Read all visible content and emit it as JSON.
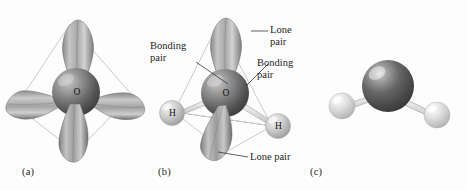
{
  "figure": {
    "background_color": "#fdfdfd",
    "panels": [
      {
        "id": "a",
        "caption": "(a)",
        "description": "Tetrahedral arrangement of four sp3 hybrid orbital lobes on oxygen",
        "atom_labels": [
          "O"
        ],
        "lobe_count": 4
      },
      {
        "id": "b",
        "caption": "(b)",
        "description": "Same tetrahedron with two bonding pairs to H atoms and two lone pairs labeled",
        "atom_labels": [
          "O",
          "H",
          "H"
        ],
        "lobe_count": 2,
        "annotations": [
          {
            "name": "lone-pair-top",
            "line1": "Lone",
            "line2": "pair"
          },
          {
            "name": "bonding-pair-left",
            "line1": "Bonding",
            "line2": "pair"
          },
          {
            "name": "bonding-pair-right",
            "line1": "Bonding",
            "line2": "pair"
          },
          {
            "name": "lone-pair-bottom",
            "line1": "Lone pair",
            "line2": ""
          }
        ]
      },
      {
        "id": "c",
        "caption": "(c)",
        "description": "Ball-and-stick bent model of water",
        "atom_labels": [],
        "lobe_count": 0
      }
    ]
  },
  "colors": {
    "oxygen_sphere_dark": "#4a4a4a",
    "oxygen_sphere_light": "#b9b9b9",
    "hydrogen_sphere_dark": "#a0a0a0",
    "hydrogen_sphere_light": "#e8e8e8",
    "lobe_dark": "#6e6e6e",
    "lobe_light": "#cfcfcf",
    "wireframe": "#b0b0b0",
    "dashed_line": "#b6a8ae",
    "text": "#1d1d1d",
    "bond_fill": "#efefef",
    "bond_stroke": "#8e8e8e"
  },
  "labels": {
    "oxygen": "O",
    "hydrogen": "H",
    "lone_top_1": "Lone",
    "lone_top_2": "pair",
    "bonding_left_1": "Bonding",
    "bonding_left_2": "pair",
    "bonding_right_1": "Bonding",
    "bonding_right_2": "pair",
    "lone_bottom": "Lone pair",
    "caption_a": "(a)",
    "caption_b": "(b)",
    "caption_c": "(c)"
  }
}
